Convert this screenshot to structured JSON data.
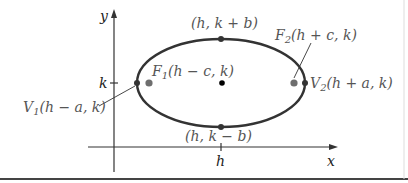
{
  "diagram": {
    "type": "ellipse-horizontal-major-axis",
    "axes": {
      "x_label": "x",
      "y_label": "y",
      "h_tick_label": "h",
      "k_tick_label": "k"
    },
    "points": {
      "top": "(h, k + b)",
      "bottom": "(h, k − b)",
      "focus1": {
        "name": "F",
        "sub": "1",
        "coords": "(h − c, k)"
      },
      "focus2": {
        "name": "F",
        "sub": "2",
        "coords": "(h + c, k)"
      },
      "vertex1": {
        "name": "V",
        "sub": "1",
        "coords": "(h − a, k)"
      },
      "vertex2": {
        "name": "V",
        "sub": "2",
        "coords": "(h + a, k)"
      }
    },
    "colors": {
      "curve": "#333333",
      "axis": "#333333",
      "focus": "#6e6e6e",
      "center": "#000000",
      "label": "#555555",
      "frame": "#444444"
    }
  }
}
